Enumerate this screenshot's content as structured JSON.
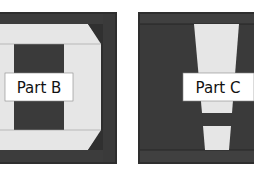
{
  "colors": {
    "dark": "#3a3a3a",
    "darker": "#2a2a2a",
    "light": "#e6e6e6",
    "label_bg": "#ffffff",
    "background": "#ffffff"
  },
  "panels": [
    {
      "id": "part-b",
      "label": "Part B"
    },
    {
      "id": "part-c",
      "label": "Part C"
    }
  ]
}
